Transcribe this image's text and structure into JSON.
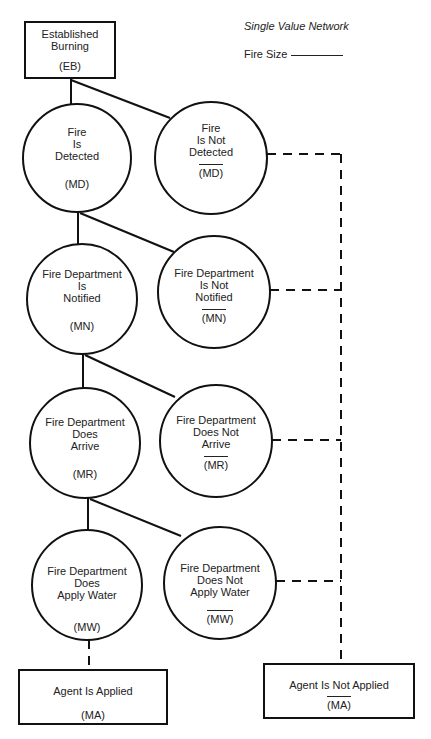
{
  "header": {
    "cut_text": ""
  },
  "legend": {
    "title": "Single Value Network",
    "fire_size_label": "Fire Size"
  },
  "nodes": {
    "eb": {
      "line1": "Established",
      "line2": "Burning",
      "abbr": "(EB)"
    },
    "md": {
      "line1": "Fire",
      "line2": "Is",
      "line3": "Detected",
      "abbr": "(MD)"
    },
    "md_not": {
      "line1": "Fire",
      "line2": "Is Not",
      "line3": "Detected",
      "abbr": "(MD)"
    },
    "mn": {
      "line1": "Fire Department",
      "line2": "Is",
      "line3": "Notified",
      "abbr": "(MN)"
    },
    "mn_not": {
      "line1": "Fire Department",
      "line2": "Is Not",
      "line3": "Notified",
      "abbr": "(MN)"
    },
    "mr": {
      "line1": "Fire Department",
      "line2": "Does",
      "line3": "Arrive",
      "abbr": "(MR)"
    },
    "mr_not": {
      "line1": "Fire Department",
      "line2": "Does Not",
      "line3": "Arrive",
      "abbr": "(MR)"
    },
    "mw": {
      "line1": "Fire Department",
      "line2": "Does",
      "line3": "Apply Water",
      "abbr": "(MW)"
    },
    "mw_not": {
      "line1": "Fire Department",
      "line2": "Does Not",
      "line3": "Apply Water",
      "abbr": "(MW)"
    },
    "ma": {
      "line1": "Agent Is Applied",
      "abbr": "(MA)"
    },
    "ma_not": {
      "line1": "Agent Is Not Applied",
      "abbr": "(MA)"
    }
  },
  "colors": {
    "stroke": "#111111",
    "background": "#ffffff"
  }
}
